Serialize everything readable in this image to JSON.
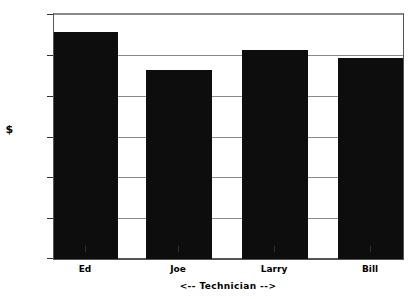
{
  "chart_data": {
    "type": "bar",
    "title": "",
    "categories": [
      "Ed",
      "Joe",
      "Larry",
      "Bill"
    ],
    "values": [
      5.55,
      4.63,
      5.12,
      4.93
    ],
    "series": [
      {
        "name": "$",
        "values": [
          5.55,
          4.63,
          5.12,
          4.93
        ]
      }
    ],
    "xlabel": "<-- Technician -->",
    "ylabel": "$",
    "ylim": [
      0,
      6
    ],
    "yticks": [
      0,
      1,
      2,
      3,
      4,
      5,
      6
    ],
    "ytick_labels": [
      "0",
      "1",
      "2",
      "3",
      "4",
      "5",
      "6"
    ],
    "grid": true,
    "legend": false,
    "bar_color": "#0d0d0d",
    "grid_color": "#8a8a8a",
    "axis_color": "#555555",
    "background_color": "#ffffff"
  }
}
